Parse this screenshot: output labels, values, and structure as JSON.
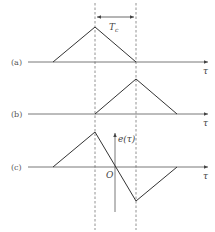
{
  "diagram": {
    "dashed_annotation": "T_c",
    "interval_label_main": "T",
    "interval_label_sub": "c",
    "panels": [
      {
        "label": "(a)",
        "axis_label": "τ",
        "shape": "triangle",
        "points": [
          [
            -1,
            0
          ],
          [
            0,
            1
          ],
          [
            1,
            0
          ]
        ]
      },
      {
        "label": "(b)",
        "axis_label": "τ",
        "shape": "triangle",
        "points": [
          [
            0,
            0
          ],
          [
            1,
            1
          ],
          [
            2,
            0
          ]
        ]
      },
      {
        "label": "(c)",
        "axis_label": "τ",
        "shape": "difference",
        "points": [
          [
            -1,
            0
          ],
          [
            0,
            1
          ],
          [
            1,
            -1
          ],
          [
            2,
            0
          ]
        ],
        "origin_label": "O",
        "vertical_axis_label": "e(τ)"
      }
    ],
    "colors": {
      "line": "#333333",
      "dashed": "#777777",
      "text": "#555555"
    }
  }
}
